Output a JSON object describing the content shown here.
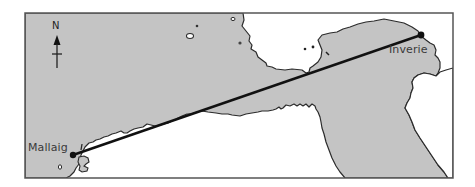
{
  "map": {
    "compass": {
      "label": "N",
      "icon": "north-arrow-icon"
    },
    "places": [
      {
        "name": "Mallaig",
        "role": "origin"
      },
      {
        "name": "Inverie",
        "role": "destination"
      }
    ],
    "route": {
      "from": "Mallaig",
      "to": "Inverie",
      "style": "straight line"
    },
    "colors": {
      "land": "#c4c4c4",
      "water": "#ffffff",
      "coastline": "#2b2b2b",
      "route": "#111111",
      "frame": "#555555"
    }
  }
}
